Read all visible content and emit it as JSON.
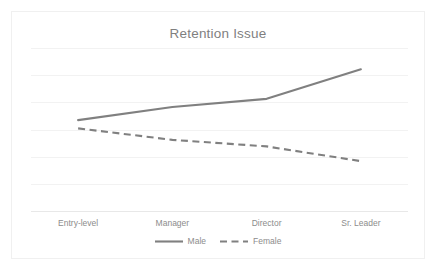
{
  "chart_data": {
    "type": "line",
    "title": "Retention Issue",
    "xlabel": "",
    "ylabel": "",
    "categories": [
      "Entry-level",
      "Manager",
      "Director",
      "Sr. Leader"
    ],
    "series": [
      {
        "name": "Male",
        "values": [
          56,
          64,
          69,
          87
        ],
        "color": "#808080",
        "style": "solid"
      },
      {
        "name": "Female",
        "values": [
          51,
          44,
          40,
          31
        ],
        "color": "#808080",
        "style": "dashed"
      }
    ],
    "ylim": [
      0,
      100
    ],
    "gridlines": [
      7
    ],
    "grid": true,
    "legend_position": "bottom",
    "legend": [
      "Male",
      "Female"
    ]
  },
  "chart": {
    "title": "Retention Issue",
    "grid_color": "#f2f2f2",
    "axis_color": "#e8e8e8",
    "border_color": "#f0f0f0",
    "text_color": "#8c8c8c",
    "series_color": "#808080"
  },
  "axis": {
    "categories": [
      "Entry-level",
      "Manager",
      "Director",
      "Sr. Leader"
    ]
  },
  "legend": {
    "items": [
      {
        "label": "Male",
        "style": "solid"
      },
      {
        "label": "Female",
        "style": "dashed"
      }
    ]
  }
}
